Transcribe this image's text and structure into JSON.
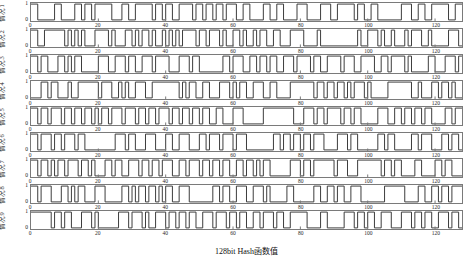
{
  "chart_data": {
    "type": "line",
    "subtype": "binary-square-wave-subplots",
    "title": "",
    "xlabel": "128bit Hash函数值",
    "x_range": [
      0,
      128
    ],
    "x_ticks": [
      0,
      20,
      40,
      60,
      80,
      100,
      120
    ],
    "y_range": [
      0,
      1
    ],
    "y_tick_labels": [
      "1",
      "0"
    ],
    "grid": false,
    "legend": "none",
    "line_color": "#3d3d3d",
    "frame_color": "#7a7a7a",
    "background": "#ffffff",
    "rows": [
      {
        "label": "情况1",
        "bits": "11000001100001101101111100011001111101101100111101101101101110011000011001100001110000111001111101100110000000111001100111110011"
      },
      {
        "label": "情况2",
        "bits": "11001111110101010001111010001101011010010101011110110111010011010010110011000111100001000000000001001110100100010111001000001110"
      },
      {
        "label": "情况3",
        "bits": "11011000110101100000111001110110011101111000111011000000011011100110110110011101111011001111011100111100110111101000001100011101"
      },
      {
        "label": "情况4",
        "bits": "00011011000100111111011100101001110011111111010110011000111010110011100110000111111101101101101011101000001111111001000110110100"
      },
      {
        "label": "情况5",
        "bits": "11011011101101101101011011101110110110111011011011011001100011100000011111111100011101101111011011000001110011011011011000011011"
      },
      {
        "label": "情况6",
        "bits": "11011101101110110000000001110110001110001100111000110111011101110000000011011011011011100001110110000001101100000110111000110110"
      },
      {
        "label": "情况7",
        "bits": "11011010110111011010001101100111011011011100110111011011011001101101011000000111011011111101110001111111011011000011000011011000"
      },
      {
        "label": "情况8",
        "bits": "11011100011010110001110000011010110110101100111000000011011001110011101000001100000011001101100111000000011111100001100110110111"
      },
      {
        "label": "情况9",
        "bits": "11111101101100011101000000111011101001110110110110011101110110110011011101100111110000110000011101101100111000111011011001110110"
      }
    ]
  }
}
